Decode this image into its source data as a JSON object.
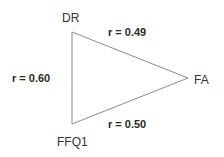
{
  "diagram": {
    "type": "triangle-correlation-diagram",
    "nodes": [
      {
        "id": "DR",
        "label": "DR"
      },
      {
        "id": "FA",
        "label": "FA"
      },
      {
        "id": "FFQ1",
        "label": "FFQ1"
      }
    ],
    "edges": [
      {
        "from": "DR",
        "to": "FA",
        "label": "r = 0.49",
        "r": 0.49
      },
      {
        "from": "DR",
        "to": "FFQ1",
        "label": "r = 0.60",
        "r": 0.6
      },
      {
        "from": "FFQ1",
        "to": "FA",
        "label": "r = 0.50",
        "r": 0.5
      }
    ],
    "colors": {
      "line": "#8a8a8a",
      "text": "#2a2a2a",
      "background": "#ffffff"
    }
  }
}
